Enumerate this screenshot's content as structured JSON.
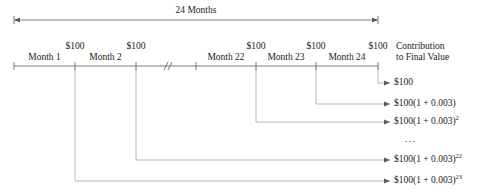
{
  "diagram": {
    "span": {
      "label": "24 Months",
      "x_start": 14,
      "x_end": 378,
      "y": 20,
      "label_x": 196,
      "label_y": 6
    },
    "axis": {
      "y": 66,
      "x_start": 14,
      "x_end": 378,
      "break_symbol": "//",
      "break_x": 167,
      "ticks": [
        14,
        75,
        136,
        196,
        256,
        316,
        378
      ]
    },
    "deposits": [
      {
        "label": "$100",
        "x": 75,
        "y": 42
      },
      {
        "label": "$100",
        "x": 136,
        "y": 42
      },
      {
        "label": "$100",
        "x": 256,
        "y": 42
      },
      {
        "label": "$100",
        "x": 316,
        "y": 42
      },
      {
        "label": "$100",
        "x": 378,
        "y": 42
      }
    ],
    "month_labels": [
      {
        "label": "Month 1",
        "x": 44.5,
        "y": 53
      },
      {
        "label": "Month 2",
        "x": 105.5,
        "y": 53
      },
      {
        "label": "Month 22",
        "x": 226,
        "y": 53
      },
      {
        "label": "Month 23",
        "x": 286,
        "y": 53
      },
      {
        "label": "Month 24",
        "x": 347,
        "y": 53
      }
    ],
    "column_header": {
      "line1": "Contribution",
      "line2": "to Final Value",
      "x": 396,
      "y1": 42,
      "y2": 53
    },
    "connectors": [
      {
        "name": "month-24-contribution",
        "from_x": 378,
        "turn_y": 83,
        "to_x": 390
      },
      {
        "name": "month-23-contribution",
        "from_x": 316,
        "turn_y": 104,
        "to_x": 390
      },
      {
        "name": "month-22-contribution",
        "from_x": 256,
        "turn_y": 122,
        "to_x": 390
      },
      {
        "name": "month-2-contribution",
        "from_x": 136,
        "turn_y": 160,
        "to_x": 390
      },
      {
        "name": "month-1-contribution",
        "from_x": 75,
        "turn_y": 181,
        "to_x": 390
      }
    ],
    "contributions": [
      {
        "base": "$100",
        "exponent": "",
        "y": 83,
        "x": 394
      },
      {
        "base": "$100(1 + 0.003)",
        "exponent": "",
        "y": 104,
        "x": 394
      },
      {
        "base": "$100(1 + 0.003)",
        "exponent": "2",
        "y": 122,
        "x": 394
      },
      {
        "base": "$100(1 + 0.003)",
        "exponent": "22",
        "y": 160,
        "x": 394
      },
      {
        "base": "$100(1 + 0.003)",
        "exponent": "23",
        "y": 181,
        "x": 394
      }
    ],
    "ellipsis": {
      "text": "...",
      "x": 405,
      "y": 140
    },
    "colors": {
      "line": "#5a5a5a",
      "text": "#1a1a1a",
      "background": "#ffffff"
    }
  }
}
